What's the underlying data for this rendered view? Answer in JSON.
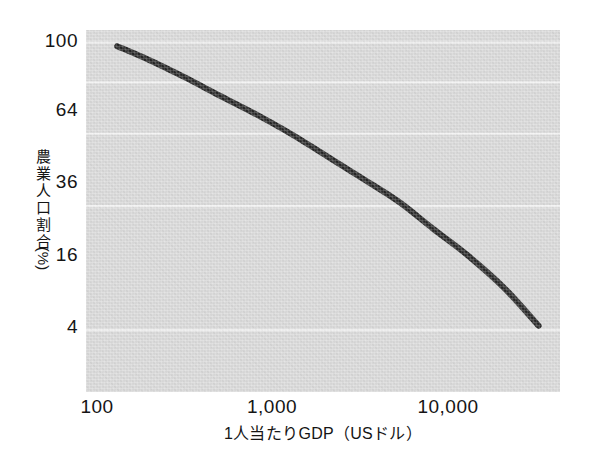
{
  "chart_data": {
    "type": "line",
    "title": "",
    "subtitle": "",
    "xlabel": "1人当たりGDP（USドル）",
    "ylabel": "農業人口割合（%）",
    "ylabel_chars": [
      "農",
      "業",
      "人",
      "口",
      "割",
      "合"
    ],
    "ylabel_unit": "(%)",
    "xscale": "log",
    "yscale": "log",
    "xlim": [
      70,
      33000
    ],
    "ylim": [
      2.0,
      115
    ],
    "xticks": [
      100,
      1000,
      10000
    ],
    "xtick_labels": [
      "100",
      "1,000",
      "10,000"
    ],
    "yticks": [
      4,
      16,
      36,
      64,
      100
    ],
    "ytick_labels": [
      "4",
      "16",
      "36",
      "64",
      "100"
    ],
    "grid": "horizontal",
    "grid_color": "#f2f2f2",
    "panel_color": "#d9d9d9",
    "line_color": "#262626",
    "line_width_px": 6,
    "legend": "none",
    "series": [
      {
        "name": "農業人口割合",
        "x": [
          105,
          160,
          250,
          400,
          630,
          1000,
          1600,
          2500,
          4000,
          6300,
          10000,
          16000,
          25000
        ],
        "y": [
          96,
          82,
          68,
          55,
          45,
          36,
          28,
          22,
          17,
          12.5,
          9.2,
          6.4,
          4.2
        ]
      }
    ],
    "annotations": []
  },
  "axes": {
    "y_ticks": [
      {
        "label": "100",
        "value": 100,
        "top_px": 41
      },
      {
        "label": "64",
        "value": 64,
        "top_px": 110
      },
      {
        "label": "36",
        "value": 36,
        "top_px": 182
      },
      {
        "label": "16",
        "value": 16,
        "top_px": 255
      },
      {
        "label": "4",
        "value": 4,
        "top_px": 327
      }
    ],
    "x_ticks": [
      {
        "label": "100",
        "value": 100,
        "left_px": 97
      },
      {
        "label": "1,000",
        "value": 1000,
        "left_px": 272
      },
      {
        "label": "10,000",
        "value": 10000,
        "left_px": 448
      }
    ]
  }
}
